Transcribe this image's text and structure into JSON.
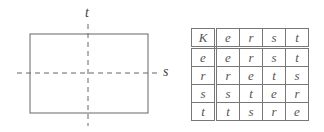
{
  "diagram": {
    "rectangle_axes": {
      "vertical_axis_label": "t",
      "horizontal_axis_label": "s"
    },
    "cayley_table": {
      "corner": "K",
      "header": [
        "e",
        "r",
        "s",
        "t"
      ],
      "rows": [
        {
          "label": "e",
          "cells": [
            "e",
            "r",
            "s",
            "t"
          ]
        },
        {
          "label": "r",
          "cells": [
            "r",
            "e",
            "t",
            "s"
          ]
        },
        {
          "label": "s",
          "cells": [
            "s",
            "t",
            "e",
            "r"
          ]
        },
        {
          "label": "t",
          "cells": [
            "t",
            "s",
            "r",
            "e"
          ]
        }
      ]
    }
  }
}
